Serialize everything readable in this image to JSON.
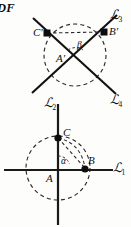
{
  "figure": {
    "corner_text": "DF",
    "top_diagram": {
      "labels": {
        "point_c_prime": "C'",
        "point_b_prime": "B'",
        "point_a_prime": "A'",
        "angle_beta": "β"
      },
      "lines": [
        {
          "name": "L3",
          "script": "ℒ",
          "subscript": "3"
        },
        {
          "name": "L4",
          "script": "ℒ",
          "subscript": "4"
        },
        {
          "name": "L2",
          "script": "ℒ",
          "subscript": "2"
        }
      ]
    },
    "bottom_diagram": {
      "labels": {
        "point_c": "C",
        "point_b": "B",
        "point_a": "A",
        "angle_alpha": "α"
      },
      "lines": [
        {
          "name": "L1",
          "script": "ℒ",
          "subscript": "1"
        }
      ]
    },
    "colors": {
      "ink": "#0d0d0d",
      "dash": "#2b2b2b",
      "paper": "#fdfdfc"
    }
  }
}
